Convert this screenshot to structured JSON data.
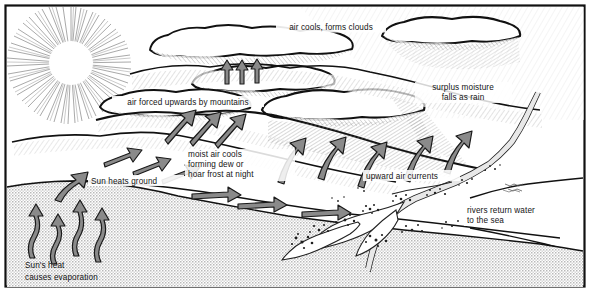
{
  "diagram": {
    "type": "illustrated-cross-section",
    "border_color": "#111111",
    "background_color": "#ffffff",
    "ink_color": "#141414",
    "sea_fill": "#d9d9d9",
    "arrow_fill": "#8a8a8a",
    "arrow_stroke": "#1a1a1a",
    "labels": [
      {
        "id": "air-cools-forms-clouds",
        "text": "air cools, forms clouds",
        "x": 330,
        "y": 29,
        "lines": [
          "air cools, forms clouds"
        ]
      },
      {
        "id": "surplus-moisture-falls-as-rain",
        "text": "surplus moisture falls as rain",
        "x": 463,
        "y": 90,
        "lines": [
          "surplus moisture",
          "falls as rain"
        ]
      },
      {
        "id": "air-forced-upwards-by-mountains",
        "text": "air forced upwards by mountains",
        "x": 188,
        "y": 104,
        "lines": [
          "air forced upwards by mountains"
        ]
      },
      {
        "id": "moist-air-cools-forming-dew-or-hoar-frost-at-night",
        "text": "moist air cools forming dew or hoar frost at night",
        "x": 240,
        "y": 157,
        "lines": [
          "moist air cools",
          "forming dew or",
          "hoar frost at night"
        ]
      },
      {
        "id": "sun-heats-ground",
        "text": "Sun heats ground",
        "x": 135,
        "y": 183,
        "lines": [
          "Sun heats ground"
        ]
      },
      {
        "id": "upward-air-currents",
        "text": "upward air currents",
        "x": 410,
        "y": 178,
        "lines": [
          "upward air currents"
        ]
      },
      {
        "id": "rivers-return-water-to-the-sea",
        "text": "rivers return water to the sea",
        "x": 510,
        "y": 213,
        "lines": [
          "rivers return water",
          "to the sea"
        ]
      },
      {
        "id": "suns-heat-causes-evaporation",
        "text": "Sun's heat causes evaporation",
        "x": 58,
        "y": 268,
        "lines": [
          "Sun's heat",
          "causes evaporation"
        ]
      }
    ],
    "elements": [
      {
        "id": "sun",
        "name": "sun-with-rays"
      },
      {
        "id": "clouds",
        "name": "cloud-bank"
      },
      {
        "id": "mountains",
        "name": "mountain-range"
      },
      {
        "id": "rain",
        "name": "rain-hatching"
      },
      {
        "id": "sea-left",
        "name": "sea-left"
      },
      {
        "id": "sea-right",
        "name": "sea-right"
      },
      {
        "id": "river",
        "name": "river-and-estuary"
      },
      {
        "id": "evaporation-arrows",
        "name": "evaporation-arrows"
      },
      {
        "id": "wind-arrows",
        "name": "horizontal-wind-arrows"
      },
      {
        "id": "updraft-arrows",
        "name": "upward-air-current-arrows"
      },
      {
        "id": "mountain-arrows",
        "name": "orographic-lift-arrows"
      }
    ]
  }
}
